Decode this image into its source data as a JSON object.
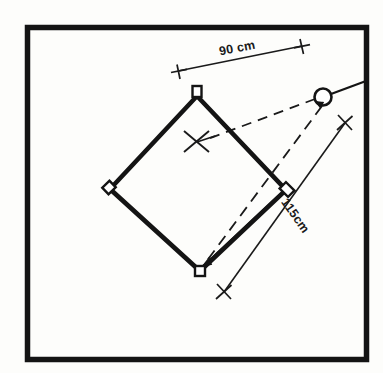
{
  "figure": {
    "background_color": "#fdfdfb",
    "ink_color": "#1a1a1a",
    "border": {
      "name": "outer-frame",
      "stroke_width": 5,
      "x": 25,
      "y": 25,
      "width": 342,
      "height": 335
    }
  },
  "labels": {
    "width_dimension": "90 cm",
    "length_dimension": "115cm"
  },
  "shape": {
    "name": "tilted-square-plot",
    "vertices": {
      "top": {
        "x": 197,
        "y": 96
      },
      "left": {
        "x": 110,
        "y": 189
      },
      "bottom": {
        "x": 200,
        "y": 271
      },
      "right": {
        "x": 286,
        "y": 190
      }
    },
    "corner_marker_size": 8,
    "stroke_width": 4.5
  },
  "center_mark": {
    "name": "center-cross-mark",
    "x": 197,
    "y": 141
  },
  "observer": {
    "name": "observer-circle",
    "x": 323,
    "y": 97,
    "radius": 8.5,
    "tail_to": {
      "x": 367,
      "y": 81
    }
  },
  "sight_lines": [
    {
      "name": "sight-line-to-center",
      "from": {
        "x": 315,
        "y": 99
      },
      "to": {
        "x": 206,
        "y": 140
      },
      "style": "dashed"
    },
    {
      "name": "sight-line-to-bottom-corner",
      "from": {
        "x": 321,
        "y": 106
      },
      "to": {
        "x": 203,
        "y": 265
      },
      "style": "dashed"
    }
  ],
  "dimensions": [
    {
      "name": "dimension-90cm",
      "label": "90 cm",
      "start": {
        "x": 178,
        "y": 71
      },
      "end": {
        "x": 302,
        "y": 46
      },
      "tick_style": "cross",
      "label_x": 238,
      "label_y": 52,
      "label_rotation": -11
    },
    {
      "name": "dimension-115cm",
      "label": "115cm",
      "start": {
        "x": 345,
        "y": 123
      },
      "end": {
        "x": 224,
        "y": 292
      },
      "tick_style": "cross",
      "label_x": 292,
      "label_y": 218,
      "label_rotation": 55
    }
  ]
}
